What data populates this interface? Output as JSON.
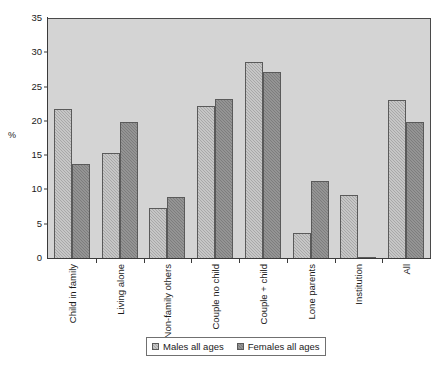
{
  "chart_data": {
    "type": "bar",
    "title": "",
    "xlabel": "",
    "ylabel": "%",
    "ylim": [
      0,
      35
    ],
    "yticks": [
      0,
      5,
      10,
      15,
      20,
      25,
      30,
      35
    ],
    "grid": false,
    "legend_position": "bottom",
    "categories": [
      "Child in family",
      "Living alone",
      "Non-family others",
      "Couple no child",
      "Couple + child",
      "Lone parents",
      "Institution",
      "All"
    ],
    "series": [
      {
        "name": "Males all ages",
        "color": "#a8a8a8",
        "values": [
          21.9,
          15.5,
          7.5,
          22.3,
          28.8,
          3.8,
          9.4,
          23.2
        ]
      },
      {
        "name": "Females all ages",
        "color": "#7d7d7d",
        "values": [
          13.8,
          20.0,
          9.1,
          23.3,
          27.3,
          11.4,
          0.3,
          20.0
        ]
      }
    ]
  },
  "legend": {
    "items": [
      {
        "label": "Males all ages",
        "swatch": "males"
      },
      {
        "label": "Females all ages",
        "swatch": "females"
      }
    ]
  }
}
